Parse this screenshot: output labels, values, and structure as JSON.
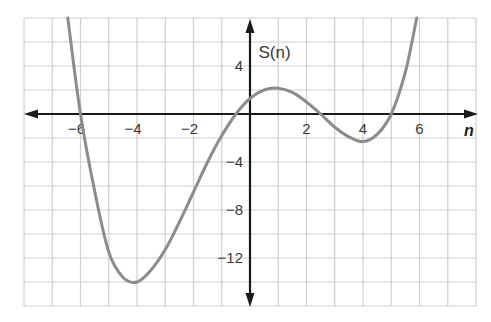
{
  "chart_data": {
    "type": "line",
    "title": "",
    "xlabel": "n",
    "ylabel": "",
    "xlim": [
      -8,
      8
    ],
    "ylim": [
      -16,
      8
    ],
    "grid": true,
    "grid_x_step": 1,
    "grid_y_step": 2,
    "x_ticks": [
      -6,
      -4,
      -2,
      2,
      4,
      6
    ],
    "x_tick_labels": [
      "−6",
      "−4",
      "−2",
      "2",
      "4",
      "6"
    ],
    "y_ticks": [
      4,
      -4,
      -8,
      -12
    ],
    "y_tick_labels": [
      "4",
      "−4",
      "−8",
      "−12"
    ],
    "legend": "none",
    "series": [
      {
        "name": "S(n)",
        "label": "S(n)",
        "label_position": [
          0.3,
          5.2
        ],
        "color": "#8c8c8c",
        "x": [
          -6.45,
          -6,
          -5.5,
          -5,
          -4.5,
          -4,
          -3.5,
          -3,
          -2.5,
          -2,
          -1.5,
          -1,
          -0.5,
          0,
          0.5,
          1,
          1.5,
          2,
          2.5,
          3,
          3.5,
          4,
          4.5,
          5,
          5.5,
          5.9
        ],
        "values": [
          8.0,
          0,
          -6.4,
          -11.5,
          -13.6,
          -14.0,
          -13.0,
          -11.3,
          -9.0,
          -6.5,
          -4.0,
          -1.8,
          0,
          1.3,
          2.0,
          2.15,
          1.8,
          1.0,
          0,
          -1.1,
          -1.9,
          -2.3,
          -1.7,
          0,
          3.5,
          8.0
        ]
      }
    ],
    "annotations": [
      {
        "text": "S(n)",
        "x": 0.3,
        "y": 5.2
      }
    ]
  },
  "labels": {
    "x_axis": "n",
    "curve": "S(n)"
  }
}
